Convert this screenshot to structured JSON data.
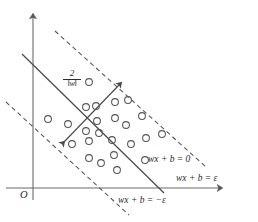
{
  "figure": {
    "background_color": "#ffffff",
    "stroke_color": "#4a4a4a",
    "axis_color": "#6b6b6b",
    "text_color": "#2b2b2b",
    "width": 258,
    "height": 222
  },
  "axes": {
    "origin_label": "O",
    "y_axis": {
      "x": 33,
      "y_top": 14,
      "y_bottom": 200
    },
    "x_axis": {
      "y": 188,
      "x_left": 6,
      "x_right": 222
    }
  },
  "labels": {
    "hyperplane": "wx + b = 0",
    "upper_margin": "wx + b = ε",
    "lower_margin": "wx + b = −ε",
    "margin_width_numerator": "2",
    "margin_width_denominator": "‖w‖"
  },
  "lines": {
    "hyperplane": {
      "x1": 22,
      "y1": 54,
      "x2": 164,
      "y2": 193,
      "style": "solid"
    },
    "upper_margin": {
      "x1": 55,
      "y1": 31,
      "x2": 206,
      "y2": 167,
      "style": "dashed"
    },
    "lower_margin": {
      "x1": 6,
      "y1": 102,
      "x2": 129,
      "y2": 215,
      "style": "dashed"
    },
    "margin_arrow": {
      "x1": 62,
      "y1": 144,
      "x2": 121,
      "y2": 83,
      "style": "double-arrow"
    }
  },
  "data_points": [
    {
      "cx": 48,
      "cy": 119
    },
    {
      "cx": 68,
      "cy": 124
    },
    {
      "cx": 72,
      "cy": 144
    },
    {
      "cx": 89,
      "cy": 82
    },
    {
      "cx": 86,
      "cy": 107
    },
    {
      "cx": 96,
      "cy": 106
    },
    {
      "cx": 97,
      "cy": 121
    },
    {
      "cx": 86,
      "cy": 131
    },
    {
      "cx": 89,
      "cy": 141
    },
    {
      "cx": 99,
      "cy": 133
    },
    {
      "cx": 89,
      "cy": 158
    },
    {
      "cx": 101,
      "cy": 163
    },
    {
      "cx": 115,
      "cy": 102
    },
    {
      "cx": 115,
      "cy": 118
    },
    {
      "cx": 112,
      "cy": 140
    },
    {
      "cx": 114,
      "cy": 155
    },
    {
      "cx": 117,
      "cy": 170
    },
    {
      "cx": 128,
      "cy": 100
    },
    {
      "cx": 126,
      "cy": 125
    },
    {
      "cx": 131,
      "cy": 144
    },
    {
      "cx": 142,
      "cy": 116
    },
    {
      "cx": 146,
      "cy": 138
    },
    {
      "cx": 145,
      "cy": 160
    },
    {
      "cx": 162,
      "cy": 134
    }
  ]
}
